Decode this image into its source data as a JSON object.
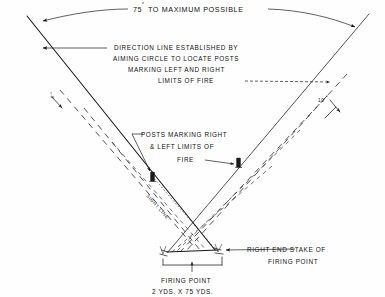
{
  "figure": {
    "title_arc_label": "75",
    "title_arc_degree": "°",
    "title_arc_rest": " TO MAXIMUM POSSIBLE",
    "annotations": {
      "arc_top": {
        "name": "maximum-possible-arc-label",
        "text_value": "75",
        "degree_symbol": "°",
        "text_rest": "TO MAXIMUM POSSIBLE"
      },
      "direction_line_block": {
        "name": "direction-line-note",
        "line1": "DIRECTION LINE ESTABLISHED BY",
        "line2": "AIMING CIRCLE TO LOCATE POSTS",
        "line3": "MARKING LEFT AND RIGHT",
        "line4": "LIMITS OF FIRE"
      },
      "posts_block": {
        "name": "posts-marking-note",
        "line1": "POSTS MARKING RIGHT",
        "line2": "& LEFT LIMITS OF",
        "line3": "FIRE"
      },
      "right_stake_block": {
        "name": "right-end-stake-note",
        "line1": "RIGHT END STAKE OF",
        "line2": "FIRING POINT"
      },
      "firing_point_block": {
        "name": "firing-point-note",
        "line1": "FIRING POINT",
        "line2": "2 YDS. X 75 YDS."
      },
      "left_angle": {
        "name": "left-angle-label",
        "value": "5",
        "degree_symbol": "°"
      },
      "right_angle": {
        "name": "right-angle-label",
        "value": "10",
        "degree_symbol": "°"
      },
      "sight_line": {
        "name": "sight-line-label",
        "text": "SIGHT LINE"
      }
    },
    "colors": {
      "ink": "#141414",
      "paper": "#fefefe",
      "dash_ink": "#2a2a2a"
    }
  }
}
